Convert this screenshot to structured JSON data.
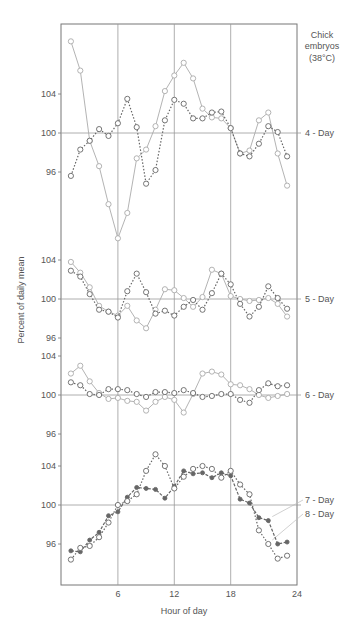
{
  "chart_data": {
    "type": "line",
    "title": "",
    "corner_label": [
      "Chick",
      "embryos",
      "(38°C)"
    ],
    "xlabel": "Hour of day",
    "ylabel": "Percent of daily mean",
    "x_ticks": [
      6,
      12,
      18,
      24
    ],
    "xlim": [
      0,
      24
    ],
    "grid": "vertical lines at 6, 12, 18; horizontal reference line at 100 per panel",
    "x": [
      1,
      2,
      3,
      4,
      5,
      6,
      7,
      8,
      9,
      10,
      11,
      12,
      13,
      14,
      15,
      16,
      17,
      18,
      19,
      20,
      21,
      22,
      23,
      24
    ],
    "panels": [
      {
        "label": "4 - Day",
        "y_ticks": [
          96,
          100,
          104
        ],
        "series": [
          {
            "name": "4-Day trial A (solid, open circles)",
            "style": "solid-open",
            "values": [
              109.4,
              106.4,
              99.2,
              96.6,
              92.7,
              89.2,
              91.8,
              97.4,
              98.3,
              100.7,
              104.3,
              105.9,
              107.2,
              105.6,
              102.5,
              101.6,
              101.5,
              100.5,
              97.9,
              98.2,
              101.3,
              102.1,
              97.9,
              94.6
            ]
          },
          {
            "name": "4-Day trial B (dotted, open circles)",
            "style": "dotted-open",
            "values": [
              95.6,
              98.3,
              99.2,
              100.4,
              99.7,
              101.0,
              103.5,
              100.6,
              94.8,
              96.2,
              101.3,
              103.4,
              103.0,
              101.5,
              101.5,
              102.1,
              102.2,
              100.5,
              97.9,
              97.6,
              98.9,
              100.7,
              100.1,
              97.6
            ]
          }
        ]
      },
      {
        "label": "5 - Day",
        "y_ticks": [
          96,
          100,
          104
        ],
        "series": [
          {
            "name": "5-Day trial A (solid, open circles)",
            "style": "solid-open",
            "values": [
              103.8,
              102.7,
              101.2,
              99.3,
              98.7,
              98.3,
              99.3,
              97.8,
              97.0,
              98.9,
              101.0,
              100.9,
              100.1,
              99.2,
              100.2,
              103.0,
              102.6,
              100.3,
              100.0,
              99.8,
              99.9,
              100.1,
              99.5,
              98.2
            ]
          },
          {
            "name": "5-Day trial B (dotted, open circles)",
            "style": "dotted-open",
            "values": [
              102.9,
              102.3,
              100.5,
              98.9,
              98.7,
              98.1,
              100.8,
              102.6,
              100.7,
              98.5,
              98.8,
              98.3,
              99.2,
              99.9,
              98.9,
              100.6,
              102.6,
              101.5,
              99.5,
              98.2,
              99.2,
              101.3,
              100.1,
              99.0
            ]
          }
        ]
      },
      {
        "label": "6 - Day",
        "y_ticks": [
          96,
          100,
          104
        ],
        "series": [
          {
            "name": "6-Day trial A (solid, open circles)",
            "style": "solid-open",
            "values": [
              102.2,
              103.0,
              101.4,
              100.2,
              99.6,
              99.7,
              99.4,
              99.3,
              98.4,
              99.3,
              99.8,
              99.5,
              98.2,
              100.1,
              102.2,
              102.4,
              102.1,
              101.1,
              101.0,
              100.6,
              100.0,
              99.7,
              99.9,
              100.1
            ]
          },
          {
            "name": "6-Day trial B (dotted, open circles)",
            "style": "dotted-open",
            "values": [
              101.3,
              101.0,
              100.1,
              100.0,
              100.6,
              100.6,
              100.5,
              100.1,
              99.8,
              100.3,
              100.3,
              100.2,
              100.5,
              100.2,
              99.8,
              99.9,
              100.1,
              100.1,
              99.5,
              99.2,
              100.5,
              101.2,
              100.9,
              101.0
            ]
          }
        ]
      },
      {
        "label": "7 - Day / 8 - Day",
        "labels": [
          "7 - Day",
          "8 - Day"
        ],
        "y_ticks": [
          96,
          100,
          104
        ],
        "series": [
          {
            "name": "7 - Day",
            "style": "dashed-filled",
            "values": [
              95.3,
              95.2,
              96.4,
              97.2,
              98.9,
              99.3,
              100.8,
              101.8,
              101.7,
              101.6,
              100.7,
              101.9,
              103.5,
              103.2,
              103.3,
              102.8,
              103.3,
              103.0,
              100.6,
              100.2,
              98.7,
              98.4,
              96.0,
              96.2
            ]
          },
          {
            "name": "8 - Day",
            "style": "dotted-open",
            "values": [
              94.4,
              95.6,
              95.8,
              96.7,
              98.2,
              100.0,
              100.4,
              101.1,
              103.5,
              105.2,
              104.0,
              101.7,
              102.9,
              103.7,
              104.0,
              103.7,
              102.8,
              103.5,
              102.1,
              101.1,
              97.4,
              96.0,
              94.5,
              94.8
            ]
          }
        ]
      }
    ]
  },
  "layout_px": {
    "plot_left": 61,
    "plot_right": 297,
    "plot_top": 24,
    "plot_bottom": 585,
    "x0_px": 61.5,
    "px_per_hour": 9.4,
    "px_per_unit": 9.75,
    "panel_y100": [
      133,
      299,
      395,
      505
    ]
  },
  "colors": {
    "frame": "#777777",
    "grid": "#9a9a9a",
    "series_light": "#aaaaaa",
    "series_dark": "#666666",
    "text": "#555555"
  }
}
